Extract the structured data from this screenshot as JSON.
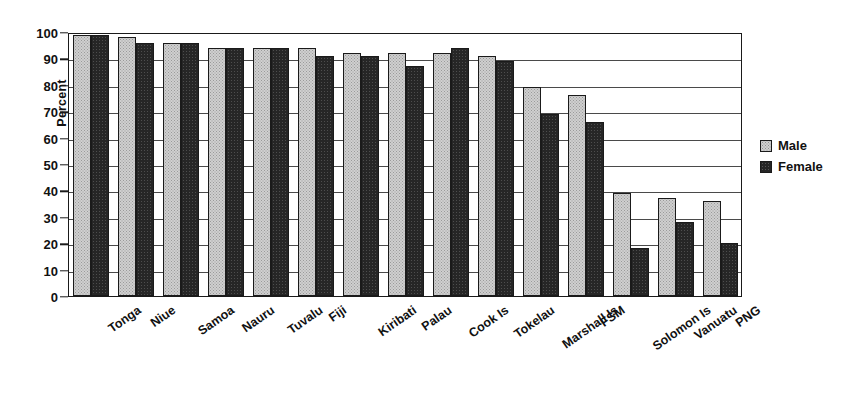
{
  "chart_data": {
    "type": "bar",
    "title": "",
    "xlabel": "",
    "ylabel": "Percent",
    "ylim": [
      0,
      100
    ],
    "ytick_step": 10,
    "yticks": [
      0,
      10,
      20,
      30,
      40,
      50,
      60,
      70,
      80,
      90,
      100
    ],
    "grid": true,
    "grid_axis": "y",
    "legend_position": "right",
    "xtick_rotation": -35,
    "categories": [
      "Tonga",
      "Niue",
      "Samoa",
      "Nauru",
      "Tuvalu",
      "Fiji",
      "Kiribati",
      "Palau",
      "Cook Is",
      "Tokelau",
      "Marshall Is",
      "FSM",
      "Solomon Is",
      "Vanuatu",
      "PNG"
    ],
    "series": [
      {
        "name": "Male",
        "color": "#cfcfcf",
        "values": [
          99,
          98,
          96,
          94,
          94,
          94,
          92,
          92,
          92,
          91,
          79,
          76,
          39,
          37,
          36
        ]
      },
      {
        "name": "Female",
        "color": "#262626",
        "values": [
          99,
          96,
          96,
          94,
          94,
          91,
          91,
          87,
          94,
          89,
          69,
          66,
          18,
          28,
          20
        ]
      }
    ]
  },
  "axis": {
    "y_title": "Percent",
    "tick_labels": [
      "100",
      "90",
      "80",
      "70",
      "60",
      "50",
      "40",
      "30",
      "20",
      "10",
      "0"
    ]
  },
  "legend": {
    "items": [
      {
        "label": "Male",
        "swatch": "male-swatch-icon"
      },
      {
        "label": "Female",
        "swatch": "female-swatch-icon"
      }
    ]
  }
}
